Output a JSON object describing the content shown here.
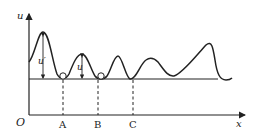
{
  "diagram": {
    "axes": {
      "y_label": "u",
      "x_label": "x",
      "origin_label": "O"
    },
    "points": [
      {
        "label": "A"
      },
      {
        "label": "B"
      },
      {
        "label": "C"
      }
    ],
    "annotations": {
      "u_prime": "u′",
      "u": "u"
    },
    "colors": {
      "line": "#222222",
      "background": "#ffffff"
    }
  }
}
